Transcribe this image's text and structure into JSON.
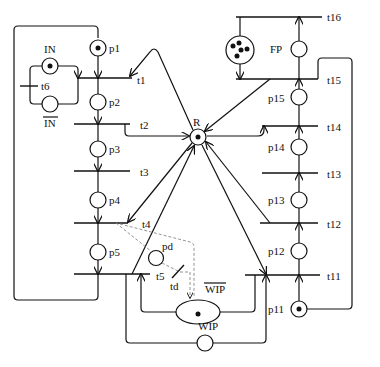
{
  "diagram": {
    "type": "petri-net",
    "places": {
      "p1": "p1",
      "p2": "p2",
      "p3": "p3",
      "p4": "p4",
      "p5": "p5",
      "p11": "p11",
      "p12": "p12",
      "p13": "p13",
      "p14": "p14",
      "p15": "p15",
      "IN": "IN",
      "IN_bar": "IN",
      "R": "R",
      "FP": "FP",
      "pd": "pd",
      "WIP": "WIP",
      "WIP_bar": "WIP"
    },
    "transitions": {
      "t1": "t1",
      "t2": "t2",
      "t3": "t3",
      "t4": "t4",
      "t5": "t5",
      "t6": "t6",
      "t11": "t11",
      "t12": "t12",
      "t13": "t13",
      "t14": "t14",
      "t15": "t15",
      "t16": "t16",
      "td": "td"
    },
    "tokens": {
      "p1": 1,
      "IN": 1,
      "R": 1,
      "p11": 1,
      "WIP_bar": 1,
      "resource_pool": 5
    }
  }
}
